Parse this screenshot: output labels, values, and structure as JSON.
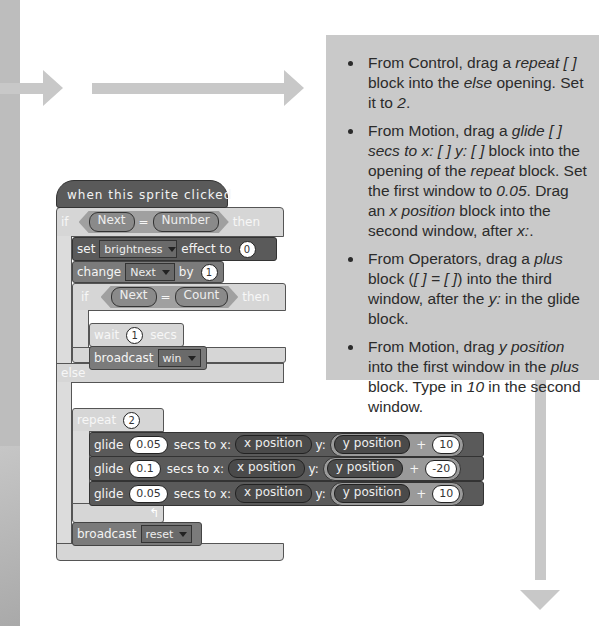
{
  "instructions": [
    {
      "parts": [
        {
          "t": "From Control, drag a "
        },
        {
          "i": "repeat [ ]"
        },
        {
          "t": " block into the "
        },
        {
          "i": "else"
        },
        {
          "t": " opening. Set it to "
        },
        {
          "i": "2"
        },
        {
          "t": "."
        }
      ]
    },
    {
      "parts": [
        {
          "t": "From Motion, drag a "
        },
        {
          "i": "glide [ ] secs to x: [ ] y: [ ]"
        },
        {
          "t": " block into the opening of the "
        },
        {
          "i": "repeat"
        },
        {
          "t": " block. Set the first window to "
        },
        {
          "i": "0.05"
        },
        {
          "t": ". Drag an "
        },
        {
          "i": "x position"
        },
        {
          "t": " block into the second window, after "
        },
        {
          "i": "x:"
        },
        {
          "t": "."
        }
      ]
    },
    {
      "parts": [
        {
          "t": "From Operators, drag a "
        },
        {
          "i": "plus"
        },
        {
          "t": " block ("
        },
        {
          "i": "[ ] = [ ]"
        },
        {
          "t": ") into the third window, after the "
        },
        {
          "i": "y:"
        },
        {
          "t": " in the glide block."
        }
      ]
    },
    {
      "parts": [
        {
          "t": "From Motion, drag "
        },
        {
          "i": "y position"
        },
        {
          "t": " into the first window in the "
        },
        {
          "i": "plus"
        },
        {
          "t": " block. Type in "
        },
        {
          "i": "10"
        },
        {
          "t": " in the second window."
        }
      ]
    }
  ],
  "script": {
    "hat": "when this sprite clicked",
    "if_kw": "if",
    "then_kw": "then",
    "else_kw": "else",
    "cond1": {
      "left": "Next",
      "op": "=",
      "right": "Number"
    },
    "set_effect": {
      "label": "set",
      "effect": "brightness",
      "to": "effect to",
      "value": "0"
    },
    "change": {
      "label": "change",
      "var": "Next",
      "by": "by",
      "value": "1"
    },
    "cond2": {
      "left": "Next",
      "op": "=",
      "right": "Count"
    },
    "wait": {
      "label": "wait",
      "value": "1",
      "unit": "secs"
    },
    "broadcast_win": {
      "label": "broadcast",
      "msg": "win"
    },
    "repeat": {
      "label": "repeat",
      "value": "2"
    },
    "glides": [
      {
        "glide": "glide",
        "secs": "0.05",
        "secs_to_x": "secs to x:",
        "x": "x position",
        "y_label": "y:",
        "y": "y position",
        "plus": "+",
        "add": "10"
      },
      {
        "glide": "glide",
        "secs": "0.1",
        "secs_to_x": "secs to x:",
        "x": "x position",
        "y_label": "y:",
        "y": "y position",
        "plus": "+",
        "add": "-20"
      },
      {
        "glide": "glide",
        "secs": "0.05",
        "secs_to_x": "secs to x:",
        "x": "x position",
        "y_label": "y:",
        "y": "y position",
        "plus": "+",
        "add": "10"
      }
    ],
    "loop_arrow": "↰",
    "broadcast_reset": {
      "label": "broadcast",
      "msg": "reset"
    }
  }
}
